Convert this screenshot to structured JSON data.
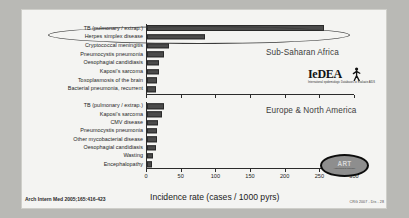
{
  "chart_data": {
    "type": "bar",
    "title": "",
    "xlabel": "Incidence rate (cases / 1000 pyrs)",
    "ylabel": "",
    "xlim": [
      0,
      300
    ],
    "xticks": [
      0,
      50,
      100,
      150,
      200,
      250,
      300
    ],
    "grid": false,
    "orientation": "horizontal",
    "panels": [
      {
        "name": "Sub-Saharan Africa",
        "categories": [
          "TB (pulmonary / extrap.)",
          "Herpes simplex disease",
          "Cryptococcal meningitis",
          "Pneumocystis pneumonia",
          "Oesophagial candidiasis",
          "Kaposi's sarcoma",
          "Toxoplasmosis of the brain",
          "Bacterial pneumonia, recurrent"
        ],
        "values": [
          255,
          84,
          32,
          25,
          18,
          17,
          15,
          13
        ]
      },
      {
        "name": "Europe & North America",
        "categories": [
          "TB (pulmonary / extrap.)",
          "Kaposi's sarcoma",
          "CMV disease",
          "Pneumocystis pneumonia",
          "Other mycobacterial disease",
          "Oesophagial candidiasis",
          "Wasting",
          "Encephalopathy"
        ],
        "values": [
          25,
          22,
          16,
          15,
          14,
          13,
          9,
          7
        ]
      }
    ],
    "annotations": {
      "highlight": "ellipse around TB (pulmonary / extrap.) in Sub-Saharan Africa panel"
    }
  },
  "logos": {
    "iedea_word": "IeDEA",
    "iedea_sub": "International epidemiologic Databases to Evaluate AIDS",
    "art_text": "ART",
    "art_sub": "Antiretroviral Therapy"
  },
  "footer": {
    "citation": "Arch Intern Med 2005;165:416-423",
    "credit": "CRG 2007 - Dis - 28"
  },
  "colors": {
    "bar_fill": "#4b4b4b",
    "bar_edge": "#2a2a2a",
    "axis": "#2b2b2b",
    "plate_bg": "#f4f4f2",
    "slide_bg": "#b9b9b5",
    "region_title": "#3d3d3d"
  }
}
